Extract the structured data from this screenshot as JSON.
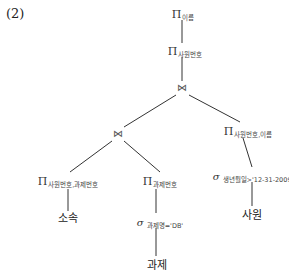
{
  "figure": {
    "number": "(2)"
  },
  "symbols": {
    "projection": "Π",
    "selection": "σ",
    "join": "⋈"
  },
  "nodes": {
    "top_projection": {
      "op": "Π",
      "attrs": "이름"
    },
    "second_projection": {
      "op": "Π",
      "attrs": "사원번호"
    },
    "top_join": {
      "op": "⋈"
    },
    "left_join": {
      "op": "⋈"
    },
    "right_projection": {
      "op": "Π",
      "attrs": "사원번호,이름"
    },
    "left_left_projection": {
      "op": "Π",
      "attrs": "사원번호,과제번호"
    },
    "left_right_projection": {
      "op": "Π",
      "attrs": "과제번호"
    },
    "right_selection": {
      "op": "σ",
      "condition": "생년월일>'12-31-2009'"
    },
    "task_selection": {
      "op": "σ",
      "condition": "과제명='DB'"
    },
    "relation_affiliation": {
      "name": "소속"
    },
    "relation_task": {
      "name": "과제"
    },
    "relation_employee": {
      "name": "사원"
    }
  },
  "edge_color": "#333333"
}
